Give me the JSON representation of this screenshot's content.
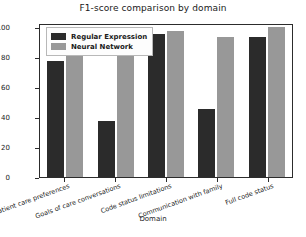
{
  "chart_data": {
    "type": "bar",
    "title": "F1-score comparison by domain",
    "xlabel": "Domain",
    "ylabel": "F1-score",
    "ylim": [
      0,
      100
    ],
    "yticks": [
      0,
      20,
      40,
      60,
      80,
      100
    ],
    "grid": false,
    "legend_position": "upper left",
    "categories": [
      "Patient care preferences",
      "Goals of care conversations",
      "Code status limitations",
      "Communication with family",
      "Full code status"
    ],
    "series": [
      {
        "name": "Regular Expression",
        "color": "#2b2b2b",
        "values": [
          76,
          37,
          94,
          45,
          92
        ]
      },
      {
        "name": "Neural Network",
        "color": "#989898",
        "values": [
          85,
          86,
          96,
          92,
          99
        ]
      }
    ]
  }
}
